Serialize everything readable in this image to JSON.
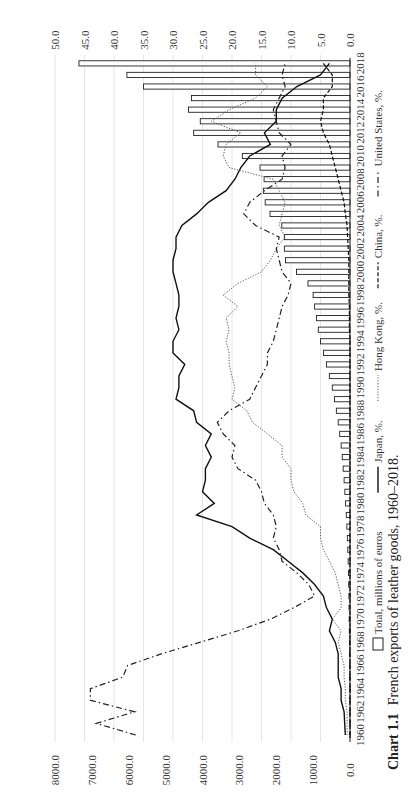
{
  "caption": {
    "label": "Chart 1.1",
    "text": "French exports of leather goods, 1960–2018."
  },
  "chart_data": {
    "type": "bar",
    "orientation": "rotated-90-clockwise (years run bottom-to-top, values increase right-to-left)",
    "title": "French exports of leather goods, 1960–2018.",
    "xlabel": "",
    "ylabel_left": "Total, millions of euros",
    "ylabel_right": "%",
    "ylim_left": [
      0,
      8000
    ],
    "yticks_left": [
      "0.0",
      "1000.0",
      "2000.0",
      "3000.0",
      "4000.0",
      "5000.0",
      "6000.0",
      "7000.0",
      "8000.0"
    ],
    "ylim_right": [
      0,
      50
    ],
    "yticks_right": [
      "0.0",
      "5.0",
      "10.0",
      "15.0",
      "20.0",
      "25.0",
      "30.0",
      "35.0",
      "40.0",
      "45.0",
      "50.0"
    ],
    "x_tick_labels": [
      "1960",
      "1962",
      "1964",
      "1966",
      "1968",
      "1970",
      "1972",
      "1974",
      "1976",
      "1978",
      "1980",
      "1982",
      "1984",
      "1986",
      "1988",
      "1990",
      "1992",
      "1994",
      "1996",
      "1998",
      "2000",
      "2002",
      "2004",
      "2006",
      "2008",
      "2010",
      "2012",
      "2014",
      "2016",
      "2018"
    ],
    "grid": true,
    "legend_position": "bottom",
    "categories": [
      1960,
      1961,
      1962,
      1963,
      1964,
      1965,
      1966,
      1967,
      1968,
      1969,
      1970,
      1971,
      1972,
      1973,
      1974,
      1975,
      1976,
      1977,
      1978,
      1979,
      1980,
      1981,
      1982,
      1983,
      1984,
      1985,
      1986,
      1987,
      1988,
      1989,
      1990,
      1991,
      1992,
      1993,
      1994,
      1995,
      1996,
      1997,
      1998,
      1999,
      2000,
      2001,
      2002,
      2003,
      2004,
      2005,
      2006,
      2007,
      2008,
      2009,
      2010,
      2011,
      2012,
      2013,
      2014,
      2015,
      2016,
      2017,
      2018
    ],
    "series": [
      {
        "name": "Total, millions of euros",
        "kind": "bar",
        "axis": "left",
        "values": [
          5,
          6,
          7,
          8,
          9,
          10,
          12,
          14,
          16,
          19,
          22,
          26,
          30,
          36,
          42,
          50,
          60,
          72,
          85,
          100,
          120,
          140,
          160,
          185,
          210,
          240,
          280,
          320,
          370,
          420,
          480,
          560,
          640,
          720,
          800,
          860,
          910,
          960,
          1000,
          1140,
          1450,
          1750,
          1780,
          1780,
          1850,
          2170,
          2300,
          2350,
          2330,
          2440,
          2920,
          3580,
          4240,
          4060,
          4380,
          4300,
          5600,
          6050,
          7350
        ]
      },
      {
        "name": "Japan, %",
        "kind": "line",
        "style": "solid",
        "axis": "right",
        "values": [
          0.8,
          0.9,
          1.0,
          1.5,
          1.5,
          2.0,
          2.0,
          2.0,
          2.5,
          3.5,
          3.0,
          4.0,
          4.5,
          6.0,
          8.0,
          10.5,
          13.0,
          17.0,
          20.0,
          26.0,
          23.0,
          25.0,
          24.5,
          24.5,
          23.5,
          24.5,
          23.5,
          26.0,
          26.5,
          29.5,
          29.0,
          29.0,
          28.0,
          30.0,
          30.0,
          29.0,
          29.5,
          29.0,
          29.0,
          29.5,
          30.0,
          30.0,
          29.5,
          29.5,
          28.5,
          26.0,
          24.0,
          21.0,
          19.5,
          18.5,
          17.0,
          13.5,
          14.5,
          12.5,
          12.5,
          11.5,
          9.0,
          5.0,
          3.5
        ]
      },
      {
        "name": "Hong Kong, %",
        "kind": "line",
        "style": "dotted",
        "axis": "right",
        "values": [
          0.5,
          0.5,
          0.5,
          0.8,
          0.8,
          1.0,
          1.0,
          1.5,
          2.0,
          1.5,
          3.0,
          1.5,
          1.5,
          2.0,
          2.5,
          3.5,
          4.5,
          5.0,
          5.0,
          7.5,
          8.0,
          9.5,
          10.0,
          10.0,
          11.5,
          11.5,
          14.0,
          16.5,
          17.5,
          20.0,
          19.5,
          20.0,
          20.5,
          20.5,
          21.0,
          20.5,
          21.0,
          19.0,
          21.5,
          19.0,
          15.0,
          13.5,
          12.5,
          11.0,
          12.0,
          11.5,
          11.0,
          12.0,
          13.0,
          20.5,
          21.5,
          21.0,
          18.5,
          23.5,
          20.5,
          16.0,
          14.0,
          16.0,
          16.0
        ]
      },
      {
        "name": "China, %",
        "kind": "line",
        "style": "dashed",
        "axis": "right",
        "values": [
          0.0,
          0.0,
          0.0,
          0.0,
          0.0,
          0.0,
          0.0,
          0.0,
          0.0,
          0.0,
          0.0,
          0.0,
          0.0,
          0.0,
          0.0,
          0.0,
          0.0,
          0.0,
          0.0,
          0.0,
          0.0,
          0.0,
          0.0,
          0.0,
          0.0,
          0.0,
          0.0,
          0.0,
          0.0,
          0.0,
          0.0,
          0.0,
          0.0,
          0.0,
          0.0,
          0.1,
          0.1,
          0.1,
          0.2,
          0.2,
          0.2,
          0.2,
          0.3,
          0.4,
          0.5,
          0.8,
          1.0,
          1.5,
          2.0,
          2.5,
          3.0,
          3.5,
          4.5,
          5.0,
          4.5,
          4.5,
          3.0,
          3.0,
          4.5
        ]
      },
      {
        "name": "United States, %",
        "kind": "line",
        "style": "dash-dot",
        "axis": "right",
        "values": [
          36.3,
          43.0,
          36.5,
          44.0,
          44.0,
          38.5,
          37.7,
          32.0,
          25.5,
          19.0,
          13.5,
          9.5,
          6.0,
          7.0,
          9.0,
          11.5,
          12.0,
          13.0,
          12.5,
          13.0,
          14.5,
          15.0,
          16.0,
          19.0,
          20.0,
          19.5,
          21.5,
          22.5,
          20.5,
          17.0,
          16.0,
          15.0,
          14.0,
          14.0,
          13.0,
          12.5,
          12.0,
          11.5,
          10.5,
          10.0,
          11.5,
          12.0,
          12.5,
          12.0,
          16.0,
          18.0,
          17.0,
          14.5,
          11.5,
          11.0,
          11.5,
          10.0,
          12.0,
          12.5,
          13.0,
          12.0,
          11.0,
          11.5,
          11.0
        ]
      }
    ]
  },
  "legend": {
    "items": [
      {
        "label": "Total, millions of euros",
        "kind": "bar"
      },
      {
        "label": "Japan, %.",
        "kind": "solid"
      },
      {
        "label": "Hong Kong, %.",
        "kind": "dotted"
      },
      {
        "label": "China, %.",
        "kind": "dashed"
      },
      {
        "label": "United States, %.",
        "kind": "dashdot"
      }
    ]
  }
}
